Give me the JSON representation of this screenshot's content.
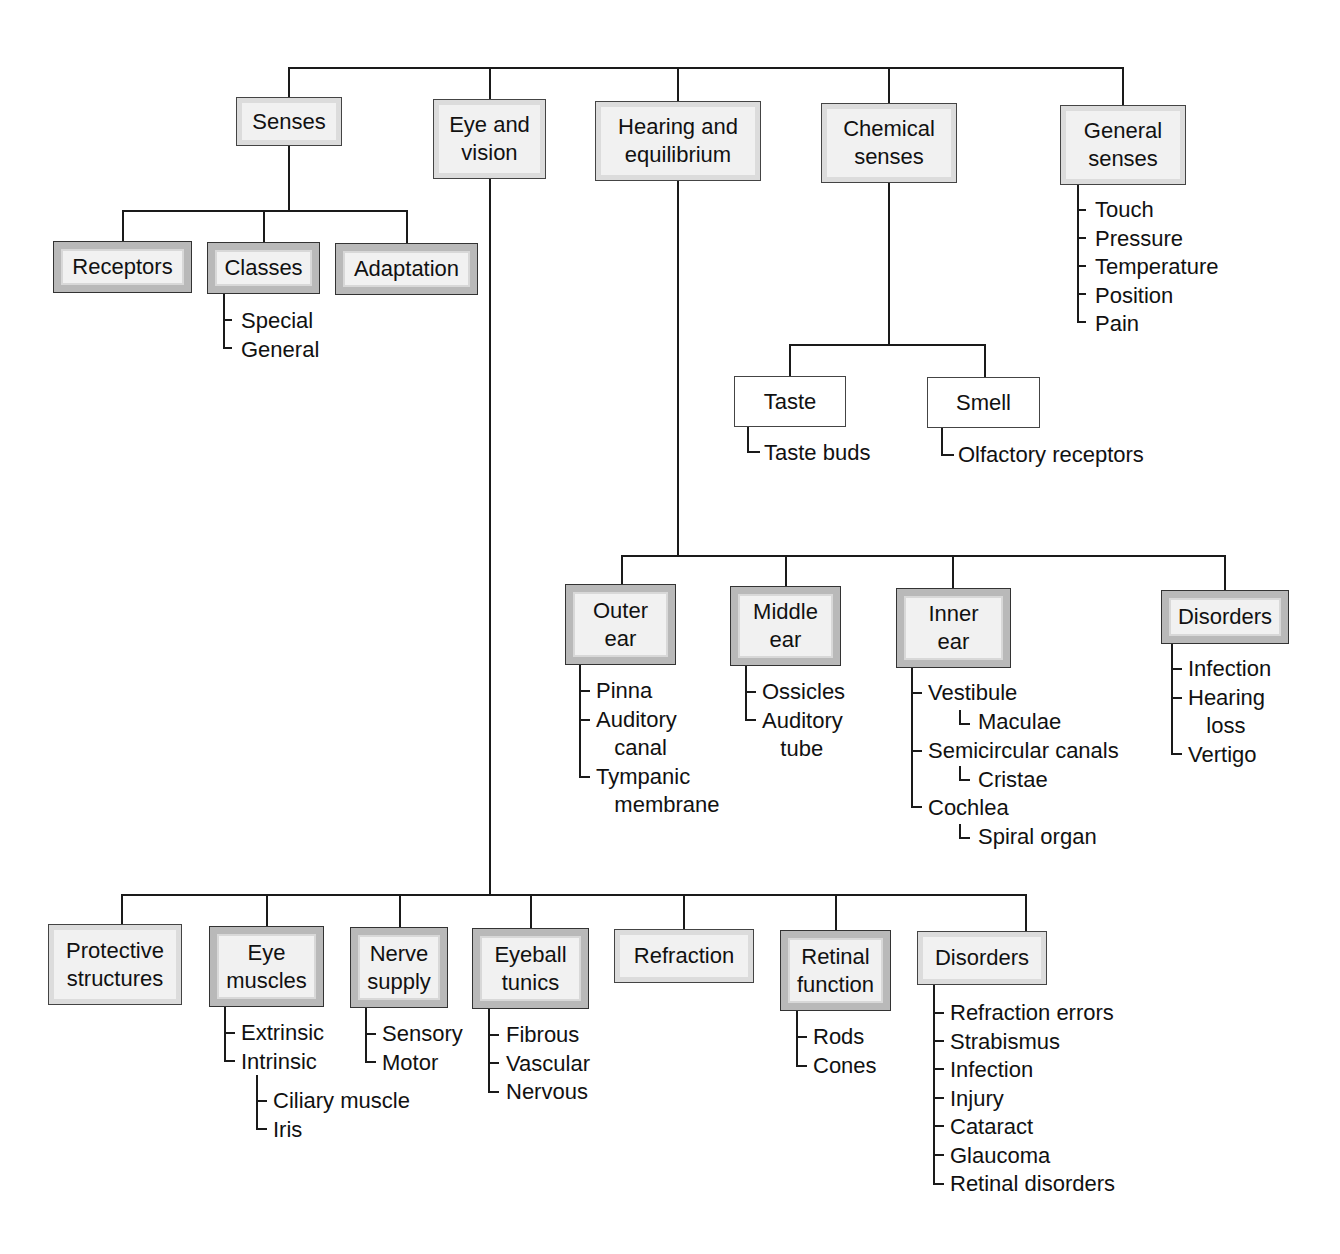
{
  "diagram": {
    "type": "concept-tree",
    "boxes": [
      {
        "id": "senses",
        "text": "Senses",
        "style": "t1",
        "x": 236,
        "y": 97,
        "w": 106,
        "h": 49
      },
      {
        "id": "eye-vision",
        "text": "Eye and\nvision",
        "style": "t1",
        "x": 433,
        "y": 99,
        "w": 113,
        "h": 80
      },
      {
        "id": "hearing",
        "text": "Hearing and\nequilibrium",
        "style": "t1",
        "x": 595,
        "y": 101,
        "w": 166,
        "h": 80
      },
      {
        "id": "chemical",
        "text": "Chemical\nsenses",
        "style": "t1",
        "x": 821,
        "y": 103,
        "w": 136,
        "h": 80
      },
      {
        "id": "general",
        "text": "General\nsenses",
        "style": "t1",
        "x": 1060,
        "y": 105,
        "w": 126,
        "h": 80
      },
      {
        "id": "receptors",
        "text": "Receptors",
        "style": "t2",
        "x": 53,
        "y": 241,
        "w": 139,
        "h": 52
      },
      {
        "id": "classes",
        "text": "Classes",
        "style": "t2",
        "x": 207,
        "y": 242,
        "w": 113,
        "h": 52
      },
      {
        "id": "adaptation",
        "text": "Adaptation",
        "style": "t2",
        "x": 335,
        "y": 243,
        "w": 143,
        "h": 52
      },
      {
        "id": "taste",
        "text": "Taste",
        "style": "t3",
        "x": 734,
        "y": 376,
        "w": 112,
        "h": 51
      },
      {
        "id": "smell",
        "text": "Smell",
        "style": "t3",
        "x": 927,
        "y": 377,
        "w": 113,
        "h": 51
      },
      {
        "id": "outer-ear",
        "text": "Outer\near",
        "style": "t2",
        "x": 565,
        "y": 584,
        "w": 111,
        "h": 81
      },
      {
        "id": "middle-ear",
        "text": "Middle\near",
        "style": "t2",
        "x": 730,
        "y": 586,
        "w": 111,
        "h": 80
      },
      {
        "id": "inner-ear",
        "text": "Inner\near",
        "style": "t2",
        "x": 896,
        "y": 588,
        "w": 115,
        "h": 80
      },
      {
        "id": "ear-disorders",
        "text": "Disorders",
        "style": "t2",
        "x": 1161,
        "y": 590,
        "w": 128,
        "h": 54
      },
      {
        "id": "protective",
        "text": "Protective\nstructures",
        "style": "t1",
        "x": 48,
        "y": 924,
        "w": 134,
        "h": 81
      },
      {
        "id": "eye-muscles",
        "text": "Eye\nmuscles",
        "style": "t2",
        "x": 209,
        "y": 926,
        "w": 115,
        "h": 81
      },
      {
        "id": "nerve-supply",
        "text": "Nerve\nsupply",
        "style": "t2",
        "x": 350,
        "y": 927,
        "w": 98,
        "h": 81
      },
      {
        "id": "eyeball-tunics",
        "text": "Eyeball\ntunics",
        "style": "t2",
        "x": 472,
        "y": 928,
        "w": 117,
        "h": 81
      },
      {
        "id": "refraction",
        "text": "Refraction",
        "style": "t1",
        "x": 614,
        "y": 929,
        "w": 140,
        "h": 54
      },
      {
        "id": "retinal-function",
        "text": "Retinal\nfunction",
        "style": "t2",
        "x": 780,
        "y": 930,
        "w": 111,
        "h": 81
      },
      {
        "id": "eye-disorders",
        "text": "Disorders",
        "style": "t1",
        "x": 917,
        "y": 931,
        "w": 130,
        "h": 54
      }
    ],
    "lists": [
      {
        "parent": "classes",
        "x": 225,
        "y": 307,
        "items": [
          "Special",
          "General"
        ],
        "indent": 0
      },
      {
        "parent": "general",
        "x": 1079,
        "y": 196,
        "items": [
          "Touch",
          "Pressure",
          "Temperature",
          "Position",
          "Pain"
        ],
        "indent": 0
      },
      {
        "parent": "taste",
        "x": 748,
        "y": 439,
        "items": [
          "Taste buds"
        ],
        "indent": 0
      },
      {
        "parent": "smell",
        "x": 942,
        "y": 441,
        "items": [
          "Olfactory receptors"
        ],
        "indent": 0
      },
      {
        "parent": "outer-ear",
        "x": 580,
        "y": 677,
        "items": [
          "Pinna",
          "Auditory\n   canal",
          "Tympanic\n   membrane"
        ],
        "indent": 0
      },
      {
        "parent": "middle-ear",
        "x": 746,
        "y": 678,
        "items": [
          "Ossicles",
          "Auditory\n   tube"
        ],
        "indent": 0
      },
      {
        "parent": "ear-disorders",
        "x": 1172,
        "y": 655,
        "items": [
          "Infection",
          "Hearing\n   loss",
          "Vertigo"
        ],
        "indent": 0
      },
      {
        "parent": "eye-muscles",
        "x": 225,
        "y": 1019,
        "items": [
          "Extrinsic",
          "Intrinsic"
        ],
        "indent": 0
      },
      {
        "parent": "nerve-supply",
        "x": 366,
        "y": 1020,
        "items": [
          "Sensory",
          "Motor"
        ],
        "indent": 0
      },
      {
        "parent": "eyeball-tunics",
        "x": 490,
        "y": 1021,
        "items": [
          "Fibrous",
          "Vascular",
          "Nervous"
        ],
        "indent": 0
      },
      {
        "parent": "retinal-function",
        "x": 797,
        "y": 1023,
        "items": [
          "Rods",
          "Cones"
        ],
        "indent": 0
      },
      {
        "parent": "eye-disorders",
        "x": 934,
        "y": 999,
        "items": [
          "Refraction errors",
          "Strabismus",
          "Infection",
          "Injury",
          "Cataract",
          "Glaucoma",
          "Retinal disorders"
        ],
        "indent": 0
      }
    ],
    "inner_ear_items": [
      {
        "text": "Vestibule",
        "sub": "Maculae"
      },
      {
        "text": "Semicircular canals",
        "sub": "Cristae"
      },
      {
        "text": "Cochlea",
        "sub": "Spiral organ"
      }
    ],
    "intrinsic_sub": [
      "Ciliary muscle",
      "Iris"
    ],
    "colors": {
      "line": "#1a1a1a",
      "box_fill": "#f1f1f1",
      "box_border_gray": "#b9b9b9"
    }
  }
}
